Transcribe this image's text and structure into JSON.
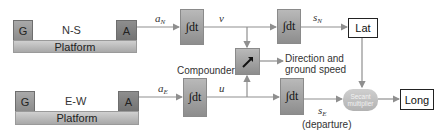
{
  "ns_platform": {
    "gyro_label": "G",
    "axis_label": "N-S",
    "accel_label": "A",
    "platform_label": "Platform"
  },
  "ew_platform": {
    "gyro_label": "G",
    "axis_label": "E-W",
    "accel_label": "A",
    "platform_label": "Platform"
  },
  "signals": {
    "a_n": "a",
    "a_n_sub": "N",
    "v": "v",
    "s_n": "s",
    "s_n_sub": "N",
    "a_e": "a",
    "a_e_sub": "E",
    "u": "u",
    "s_e": "s",
    "s_e_sub": "E",
    "s_e_note": "(departure)"
  },
  "blocks": {
    "integrator_symbol": "∫dt",
    "compounder_label": "Compounder",
    "compounder_icon": "arrow-up-right-icon",
    "direction_line1": "Direction and",
    "direction_line2": "ground speed",
    "secant_line1": "Secant",
    "secant_line2": "multiplier",
    "lat_label": "Lat",
    "long_label": "Long"
  },
  "colors": {
    "wire": "#8f8f8f",
    "box_gray": "#a0a0a0",
    "box_dark": "#7f7f7f",
    "output_border": "#222222"
  }
}
